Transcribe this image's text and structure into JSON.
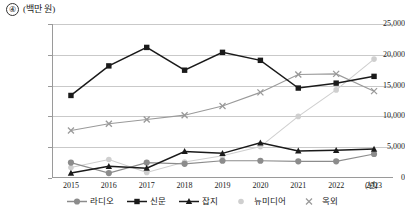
{
  "header": {
    "number": "④",
    "unit_label": "(백만 원)"
  },
  "axis": {
    "x_unit": "(년)"
  },
  "chart_data": {
    "type": "line",
    "title": "",
    "subtitle": "",
    "xlabel": "(년)",
    "ylabel": "(백만 원)",
    "categories": [
      "2015",
      "2016",
      "2017",
      "2018",
      "2019",
      "2020",
      "2021",
      "2022",
      "2023"
    ],
    "x": [
      2015,
      2016,
      2017,
      2018,
      2019,
      2020,
      2021,
      2022,
      2023
    ],
    "ylim": [
      0,
      25000
    ],
    "yticks": [
      0,
      5000,
      10000,
      15000,
      20000,
      25000
    ],
    "ytick_labels": [
      "0",
      "5,000",
      "10,000",
      "15,000",
      "20,000",
      "25,000"
    ],
    "grid": true,
    "legend_position": "bottom",
    "series": [
      {
        "name": "라디오",
        "marker": "circle",
        "color": "#8c8c8c",
        "values": [
          2500,
          800,
          2500,
          2300,
          2800,
          2800,
          2700,
          2700,
          3900
        ]
      },
      {
        "name": "신문",
        "marker": "square",
        "color": "#1a1a1a",
        "values": [
          13400,
          18200,
          21200,
          17500,
          20400,
          19100,
          14600,
          15400,
          16500
        ]
      },
      {
        "name": "잡지",
        "marker": "triangle",
        "color": "#1a1a1a",
        "values": [
          800,
          1900,
          1600,
          4300,
          4000,
          5700,
          4400,
          4500,
          4700
        ]
      },
      {
        "name": "뉴미디어",
        "marker": "dot",
        "color": "#cfcfcf",
        "values": [
          1700,
          3000,
          900,
          2600,
          3600,
          5100,
          10000,
          14300,
          19300
        ]
      },
      {
        "name": "옥외",
        "marker": "x",
        "color": "#9a9a9a",
        "values": [
          7700,
          8800,
          9500,
          10200,
          11700,
          13900,
          16800,
          16900,
          14100
        ]
      }
    ]
  }
}
